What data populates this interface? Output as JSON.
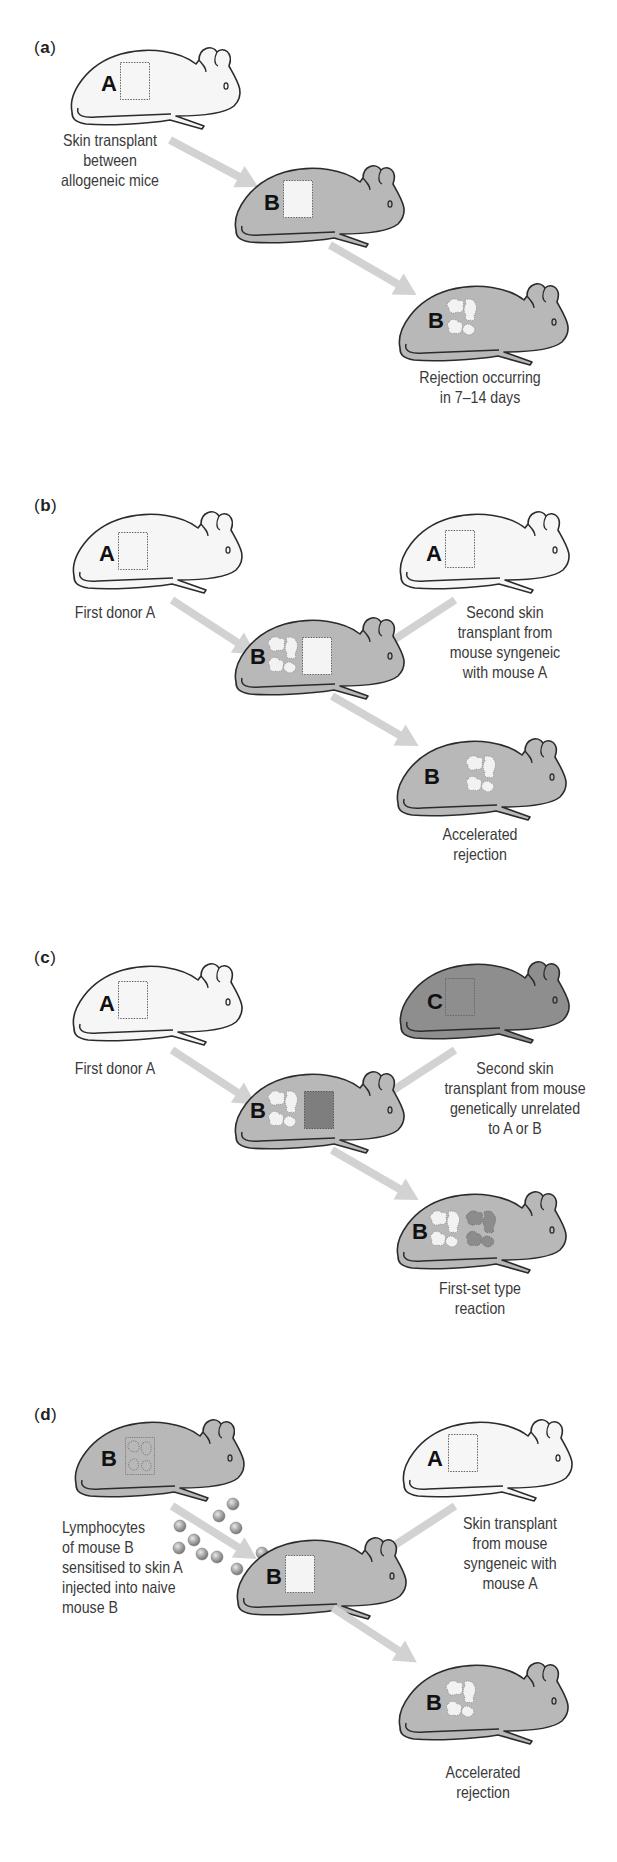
{
  "figure": {
    "colors": {
      "white_mouse": "#f6f6f6",
      "gray_mouse": "#b8b8b8",
      "dark_mouse": "#8e8e8e",
      "outline": "#2b2b2b",
      "arrow": "#d2d2d2",
      "graft_fresh": "#f4f4f4",
      "graft_dark": "#808080",
      "lymphocyte": "#9a9a9a"
    },
    "panels": [
      {
        "id": "a",
        "label_open": "(",
        "label_letter": "a",
        "label_close": ")",
        "mice": [
          {
            "role": "donor",
            "letter": "A",
            "color": "white",
            "graft": "fresh"
          },
          {
            "role": "recipient",
            "letter": "B",
            "color": "gray",
            "graft": "fresh"
          },
          {
            "role": "outcome",
            "letter": "B",
            "color": "gray",
            "graft": "rejected"
          }
        ],
        "captions": {
          "donor": [
            "Skin transplant",
            "between",
            "allogeneic mice"
          ],
          "outcome": [
            "Rejection occurring",
            "in 7–14 days"
          ]
        }
      },
      {
        "id": "b",
        "label_open": "(",
        "label_letter": "b",
        "label_close": ")",
        "mice": [
          {
            "role": "first-donor",
            "letter": "A",
            "color": "white",
            "graft": "fresh"
          },
          {
            "role": "second-donor",
            "letter": "A",
            "color": "white",
            "graft": "fresh"
          },
          {
            "role": "recipient",
            "letter": "B",
            "color": "gray",
            "graft": "rejected+fresh"
          },
          {
            "role": "outcome",
            "letter": "B",
            "color": "gray",
            "graft": "rejected"
          }
        ],
        "captions": {
          "first_donor": [
            "First donor A"
          ],
          "second_donor": [
            "Second skin",
            "transplant from",
            "mouse syngeneic",
            "with mouse A"
          ],
          "outcome": [
            "Accelerated",
            "rejection"
          ]
        }
      },
      {
        "id": "c",
        "label_open": "(",
        "label_letter": "c",
        "label_close": ")",
        "mice": [
          {
            "role": "first-donor",
            "letter": "A",
            "color": "white",
            "graft": "fresh"
          },
          {
            "role": "second-donor",
            "letter": "C",
            "color": "dark",
            "graft": "fresh-dark"
          },
          {
            "role": "recipient",
            "letter": "B",
            "color": "gray",
            "graft": "rejected+dark"
          },
          {
            "role": "outcome",
            "letter": "B",
            "color": "gray",
            "graft": "rejected+rejected-dark"
          }
        ],
        "captions": {
          "first_donor": [
            "First donor A"
          ],
          "second_donor": [
            "Second skin",
            "transplant from mouse",
            "genetically unrelated",
            "to A or B"
          ],
          "outcome": [
            "First-set type",
            "reaction"
          ]
        }
      },
      {
        "id": "d",
        "label_open": "(",
        "label_letter": "d",
        "label_close": ")",
        "mice": [
          {
            "role": "sensitised-donor",
            "letter": "B",
            "color": "gray",
            "graft": "faded"
          },
          {
            "role": "skin-donor",
            "letter": "A",
            "color": "white",
            "graft": "fresh"
          },
          {
            "role": "recipient",
            "letter": "B",
            "color": "gray",
            "graft": "fresh"
          },
          {
            "role": "outcome",
            "letter": "B",
            "color": "gray",
            "graft": "rejected"
          }
        ],
        "captions": {
          "lymphocytes": [
            "Lymphocytes",
            "of mouse B",
            "sensitised to skin A",
            "injected into naive",
            "mouse B"
          ],
          "skin_donor": [
            "Skin transplant",
            "from mouse",
            "syngeneic with",
            "mouse A"
          ],
          "outcome": [
            "Accelerated",
            "rejection"
          ]
        },
        "lymphocyte_count": 10
      }
    ]
  }
}
